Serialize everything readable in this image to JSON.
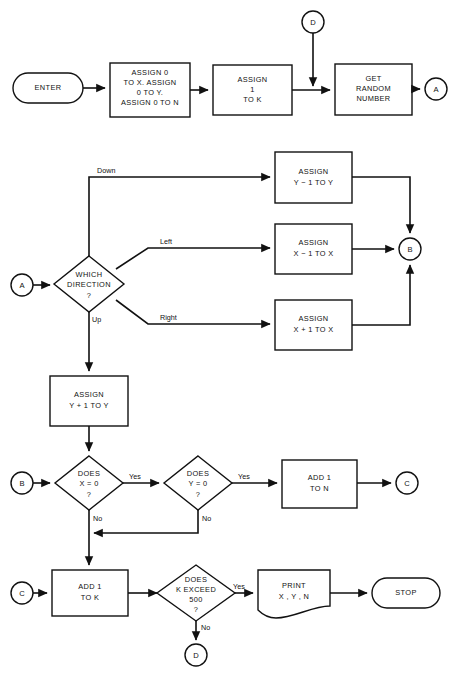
{
  "diagram": {
    "stroke_color": "#111111",
    "fill_color": "#ffffff",
    "background": "#ffffff"
  },
  "nodes": {
    "enter": {
      "label": "ENTER",
      "shape": "terminator"
    },
    "init": {
      "line1": "ASSIGN 0",
      "line2": "TO X.  ASSIGN",
      "line3": "0 TO Y.",
      "line4": "ASSIGN 0 TO N",
      "shape": "process"
    },
    "assign_k": {
      "line1": "ASSIGN",
      "line2": "1",
      "line3": "TO K",
      "shape": "process"
    },
    "get_random": {
      "line1": "GET",
      "line2": "RANDOM",
      "line3": "NUMBER",
      "shape": "process"
    },
    "which_direction": {
      "line1": "WHICH",
      "line2": "DIRECTION",
      "line3": "?",
      "shape": "decision"
    },
    "y_minus": {
      "line1": "ASSIGN",
      "line2": "Y − 1 TO Y",
      "shape": "process"
    },
    "x_minus": {
      "line1": "ASSIGN",
      "line2": "X − 1 TO X",
      "shape": "process"
    },
    "x_plus": {
      "line1": "ASSIGN",
      "line2": "X + 1 TO X",
      "shape": "process"
    },
    "y_plus": {
      "line1": "ASSIGN",
      "line2": "Y + 1 TO Y",
      "shape": "process"
    },
    "does_x_zero": {
      "line1": "DOES",
      "line2": "X = 0",
      "line3": "?",
      "shape": "decision"
    },
    "does_y_zero": {
      "line1": "DOES",
      "line2": "Y = 0",
      "line3": "?",
      "shape": "decision"
    },
    "add_n": {
      "line1": "ADD 1",
      "line2": "TO N",
      "shape": "process"
    },
    "add_k": {
      "line1": "ADD 1",
      "line2": "TO K",
      "shape": "process"
    },
    "does_k_exceed": {
      "line1": "DOES",
      "line2": "K EXCEED",
      "line3": "500",
      "line4": "?",
      "shape": "decision"
    },
    "print": {
      "line1": "PRINT",
      "line2": "X , Y , N",
      "shape": "document"
    },
    "stop": {
      "label": "STOP",
      "shape": "terminator"
    }
  },
  "connectors": {
    "a_top": {
      "label": "A"
    },
    "a_left": {
      "label": "A"
    },
    "b_right": {
      "label": "B"
    },
    "b_left": {
      "label": "B"
    },
    "c_right": {
      "label": "C"
    },
    "c_left": {
      "label": "C"
    },
    "d_top": {
      "label": "D"
    },
    "d_bottom": {
      "label": "D"
    }
  },
  "edge_labels": {
    "down": "Down",
    "left": "Left",
    "right": "Right",
    "up": "Up",
    "yes_x": "Yes",
    "no_x": "No",
    "yes_y": "Yes",
    "no_y": "No",
    "yes_k": "Yes",
    "no_k": "No"
  }
}
